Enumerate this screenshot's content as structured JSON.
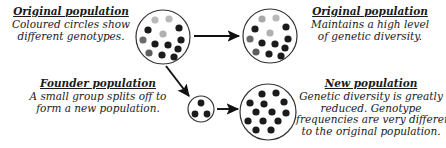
{
  "diagram": {
    "title_semantic": "founder-effect-genetic-diversity-diagram",
    "background_color": "#ffffff",
    "text_color": "#1a1a1a",
    "circle_outline_color": "#333333",
    "arrow_color": "#111111"
  },
  "panels": {
    "original_population_left": {
      "heading": "Original population",
      "lines": [
        "Coloured circles show",
        "different genotypes."
      ]
    },
    "original_population_right": {
      "heading": "Original population",
      "lines": [
        "Maintains a high level",
        "of genetic diversity."
      ]
    },
    "founder_population": {
      "heading": "Founder population",
      "lines": [
        "A small group splits off to",
        "form a new population."
      ]
    },
    "new_population": {
      "heading": "New population",
      "lines": [
        "Genetic diversity is greatly",
        "reduced.  Genotype",
        "frequencies are very different",
        "to the original population."
      ]
    }
  },
  "dot_palette": {
    "black": "#1b1b1b",
    "dark_grey": "#5d5d5d",
    "mid_grey": "#8f8f8f",
    "light_grey": "#c0c0c0"
  },
  "populations": [
    {
      "name": "original-population-circle",
      "cx": 163,
      "cy": 37,
      "r": 27,
      "dot_r": 3.6,
      "dot_count": 13,
      "dots": [
        {
          "x": 155,
          "y": 20,
          "color": "#b9b9b9"
        },
        {
          "x": 169,
          "y": 19,
          "color": "#b9b9b9"
        },
        {
          "x": 148,
          "y": 30,
          "color": "#1b1b1b"
        },
        {
          "x": 179,
          "y": 28,
          "color": "#1b1b1b"
        },
        {
          "x": 163,
          "y": 34,
          "color": "#b0b0b0"
        },
        {
          "x": 143,
          "y": 40,
          "color": "#6a6a6a"
        },
        {
          "x": 181,
          "y": 40,
          "color": "#1b1b1b"
        },
        {
          "x": 155,
          "y": 44,
          "color": "#1b1b1b"
        },
        {
          "x": 168,
          "y": 45,
          "color": "#1b1b1b"
        },
        {
          "x": 178,
          "y": 49,
          "color": "#1b1b1b"
        },
        {
          "x": 149,
          "y": 53,
          "color": "#5d5d5d"
        },
        {
          "x": 162,
          "y": 55,
          "color": "#1b1b1b"
        },
        {
          "x": 174,
          "y": 57,
          "color": "#1b1b1b"
        }
      ]
    },
    {
      "name": "original-population-result-circle",
      "cx": 270,
      "cy": 36,
      "r": 27,
      "dot_r": 3.6,
      "dot_count": 13,
      "dots": [
        {
          "x": 262,
          "y": 19,
          "color": "#a8a8a8"
        },
        {
          "x": 276,
          "y": 18,
          "color": "#b9b9b9"
        },
        {
          "x": 255,
          "y": 29,
          "color": "#1b1b1b"
        },
        {
          "x": 286,
          "y": 27,
          "color": "#1b1b1b"
        },
        {
          "x": 270,
          "y": 33,
          "color": "#b0b0b0"
        },
        {
          "x": 250,
          "y": 39,
          "color": "#6a6a6a"
        },
        {
          "x": 288,
          "y": 39,
          "color": "#1b1b1b"
        },
        {
          "x": 262,
          "y": 43,
          "color": "#1b1b1b"
        },
        {
          "x": 275,
          "y": 44,
          "color": "#1b1b1b"
        },
        {
          "x": 285,
          "y": 48,
          "color": "#1b1b1b"
        },
        {
          "x": 256,
          "y": 52,
          "color": "#5d5d5d"
        },
        {
          "x": 269,
          "y": 54,
          "color": "#1b1b1b"
        },
        {
          "x": 281,
          "y": 56,
          "color": "#1b1b1b"
        }
      ]
    },
    {
      "name": "founder-population-circle",
      "cx": 201,
      "cy": 109,
      "r": 13,
      "dot_r": 3.4,
      "dot_count": 3,
      "dots": [
        {
          "x": 201,
          "y": 103,
          "color": "#1b1b1b"
        },
        {
          "x": 195,
          "y": 114,
          "color": "#1b1b1b"
        },
        {
          "x": 207,
          "y": 114,
          "color": "#1b1b1b"
        }
      ]
    },
    {
      "name": "new-population-circle",
      "cx": 268,
      "cy": 112,
      "r": 28,
      "dot_r": 3.6,
      "dot_count": 13,
      "dots": [
        {
          "x": 262,
          "y": 94,
          "color": "#1b1b1b"
        },
        {
          "x": 276,
          "y": 93,
          "color": "#1b1b1b"
        },
        {
          "x": 250,
          "y": 103,
          "color": "#1b1b1b"
        },
        {
          "x": 264,
          "y": 104,
          "color": "#1b1b1b"
        },
        {
          "x": 284,
          "y": 102,
          "color": "#1b1b1b"
        },
        {
          "x": 256,
          "y": 112,
          "color": "#1b1b1b"
        },
        {
          "x": 272,
          "y": 112,
          "color": "#1b1b1b"
        },
        {
          "x": 286,
          "y": 113,
          "color": "#1b1b1b"
        },
        {
          "x": 248,
          "y": 121,
          "color": "#1b1b1b"
        },
        {
          "x": 263,
          "y": 121,
          "color": "#1b1b1b"
        },
        {
          "x": 278,
          "y": 121,
          "color": "#1b1b1b"
        },
        {
          "x": 256,
          "y": 130,
          "color": "#1b1b1b"
        },
        {
          "x": 271,
          "y": 130,
          "color": "#1b1b1b"
        }
      ]
    }
  ],
  "arrows": [
    {
      "name": "arrow-original-to-original",
      "x1": 194,
      "y1": 36,
      "x2": 239,
      "y2": 36
    },
    {
      "name": "arrow-original-to-founder",
      "x1": 166,
      "y1": 66,
      "x2": 189,
      "y2": 96
    },
    {
      "name": "arrow-founder-to-new",
      "x1": 217,
      "y1": 109,
      "x2": 238,
      "y2": 109
    }
  ]
}
